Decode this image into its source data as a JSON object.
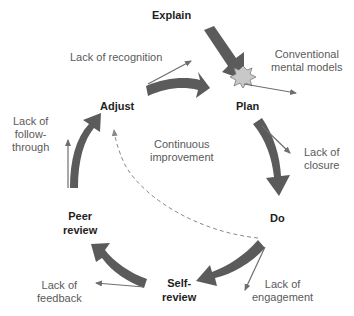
{
  "diagram": {
    "type": "cycle",
    "colors": {
      "big_arrow": "#5b5b5b",
      "thin_arrow": "#6e6e6e",
      "burst_fill": "#c8c8c8",
      "burst_stroke": "#7a7a7a",
      "dashed": "#8a8a8a",
      "stage_text": "#1e1e1e",
      "barrier_text": "#5a5a5a"
    },
    "stages": {
      "explain": "Explain",
      "plan": "Plan",
      "do": "Do",
      "self_review_1": "Self-",
      "self_review_2": "review",
      "peer_review_1": "Peer",
      "peer_review_2": "review",
      "adjust": "Adjust"
    },
    "barriers": {
      "recognition": "Lack of recognition",
      "conventional_1": "Conventional",
      "conventional_2": "mental models",
      "closure_1": "Lack of",
      "closure_2": "closure",
      "engagement_1": "Lack of",
      "engagement_2": "engagement",
      "feedback_1": "Lack of",
      "feedback_2": "feedback",
      "followthrough_1": "Lack of",
      "followthrough_2": "follow-",
      "followthrough_3": "through"
    },
    "center": {
      "line1": "Continuous",
      "line2": "improvement"
    }
  }
}
